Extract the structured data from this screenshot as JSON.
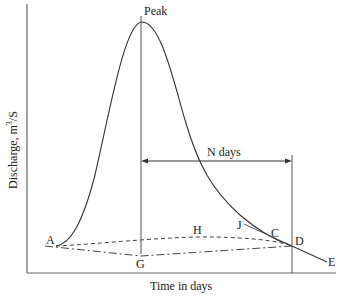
{
  "diagram": {
    "type": "hydrograph",
    "xlabel": "Time in days",
    "ylabel": "Discharge, m",
    "ylabel_sup": "3",
    "ylabel_suffix": "/S",
    "annotations": {
      "peak": "Peak",
      "n_days": "N days",
      "points": {
        "A": "A",
        "G": "G",
        "H": "H",
        "J": "J",
        "C": "C",
        "D": "D",
        "E": "E"
      }
    },
    "colors": {
      "line": "#333333",
      "axis": "#555555"
    }
  }
}
